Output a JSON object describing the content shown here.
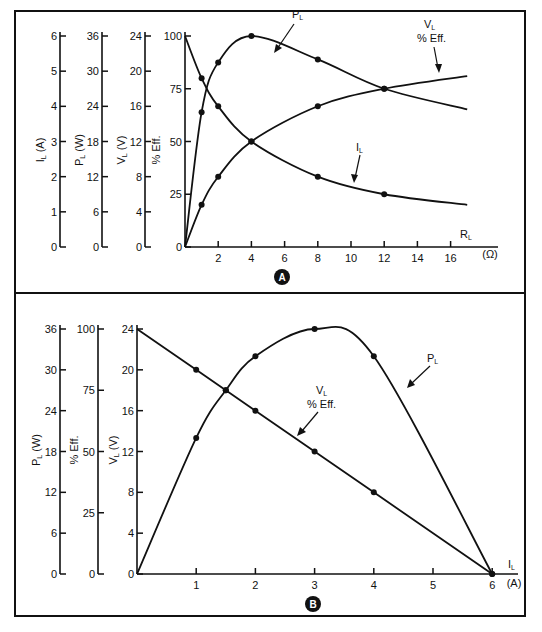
{
  "figure": {
    "panel_a_label": "A",
    "panel_b_label": "B"
  },
  "chart_data": [
    {
      "type": "line",
      "panel": "A",
      "xlabel": "R_L (Ω)",
      "x_ticks": [
        2,
        4,
        6,
        8,
        10,
        12,
        14,
        16
      ],
      "xlim": [
        0,
        18
      ],
      "y_axes": [
        {
          "label": "I_L (A)",
          "ticks": [
            0,
            1,
            2,
            3,
            4,
            5,
            6
          ],
          "range": [
            0,
            6
          ]
        },
        {
          "label": "P_L (W)",
          "ticks": [
            0,
            6,
            12,
            18,
            24,
            30,
            36
          ],
          "range": [
            0,
            36
          ]
        },
        {
          "label": "V_L (V)",
          "ticks": [
            0,
            4,
            8,
            12,
            16,
            20,
            24
          ],
          "range": [
            0,
            24
          ]
        },
        {
          "label": "% Eff.",
          "ticks": [
            0,
            25,
            50,
            75,
            100
          ],
          "range": [
            0,
            100
          ]
        }
      ],
      "series": [
        {
          "name": "P_L",
          "axis_units": "W",
          "x": [
            0,
            1,
            2,
            4,
            8,
            12,
            17
          ],
          "y": [
            0,
            23.0,
            31.5,
            36,
            32,
            27,
            23.5
          ],
          "marked_points_x": [
            1,
            2,
            4,
            8,
            12
          ]
        },
        {
          "name": "V_L / % Eff.",
          "axis_units": "%",
          "x": [
            0,
            1,
            2,
            4,
            8,
            12,
            17
          ],
          "y": [
            0,
            20,
            33.3,
            50,
            66.7,
            75,
            81
          ],
          "marked_points_x": [
            1,
            2,
            4,
            8,
            12
          ]
        },
        {
          "name": "I_L",
          "axis_units": "A",
          "x": [
            0,
            1,
            2,
            4,
            8,
            12,
            17
          ],
          "y": [
            6,
            4.8,
            4,
            3,
            2,
            1.5,
            1.2
          ],
          "marked_points_x": [
            1,
            2,
            4,
            8,
            12
          ]
        }
      ],
      "annotations": [
        "P_L",
        "V_L % Eff.",
        "I_L"
      ]
    },
    {
      "type": "line",
      "panel": "B",
      "xlabel": "I_L (A)",
      "x_ticks": [
        1,
        2,
        3,
        4,
        5,
        6
      ],
      "xlim": [
        0,
        6.4
      ],
      "y_axes": [
        {
          "label": "P_L (W)",
          "ticks": [
            0,
            6,
            12,
            18,
            24,
            30,
            36
          ],
          "range": [
            0,
            36
          ]
        },
        {
          "label": "% Eff.",
          "ticks": [
            0,
            25,
            50,
            75,
            100
          ],
          "range": [
            0,
            100
          ]
        },
        {
          "label": "V_L (V)",
          "ticks": [
            0,
            4,
            8,
            12,
            16,
            20,
            24
          ],
          "range": [
            0,
            24
          ]
        }
      ],
      "series": [
        {
          "name": "P_L",
          "axis_units": "W",
          "x": [
            0,
            1,
            1.5,
            2,
            3,
            4,
            6
          ],
          "y": [
            0,
            20,
            27,
            32,
            36,
            32,
            0
          ],
          "marked_points_x": [
            1,
            1.5,
            2,
            3,
            4,
            6
          ]
        },
        {
          "name": "V_L / % Eff.",
          "axis_units": "V",
          "x": [
            0,
            1,
            1.5,
            2,
            3,
            4,
            6
          ],
          "y": [
            24,
            20,
            18,
            16,
            12,
            8,
            0
          ],
          "marked_points_x": [
            1,
            1.5,
            2,
            3,
            4,
            6
          ]
        }
      ],
      "annotations": [
        "P_L",
        "V_L % Eff."
      ]
    }
  ]
}
